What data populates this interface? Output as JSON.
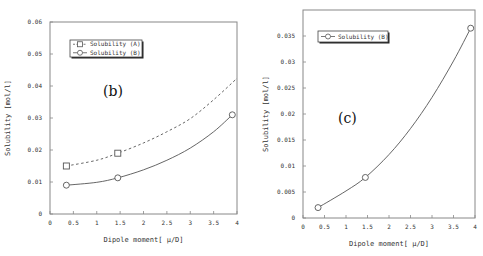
{
  "chart_data": [
    {
      "id": "b",
      "type": "line",
      "panel_label": "(b)",
      "title": "",
      "xlabel": "Dipole moment[ μ/D]",
      "ylabel": "Solubility [mol/l]",
      "xlim": [
        0,
        4
      ],
      "ylim": [
        0,
        0.06
      ],
      "xticks": [
        0,
        0.5,
        1,
        1.5,
        2,
        2.5,
        3,
        3.5,
        4
      ],
      "xtick_labels": [
        "0",
        "0.5",
        "1",
        "1.5",
        "2",
        "2.5",
        "3",
        "3.5",
        "4"
      ],
      "yticks": [
        0,
        0.01,
        0.02,
        0.03,
        0.04,
        0.05,
        0.06
      ],
      "ytick_labels": [
        "0",
        "0.01",
        "0.02",
        "0.03",
        "0.04",
        "0.05",
        "0.06"
      ],
      "grid": false,
      "legend_position": "upper-left",
      "series": [
        {
          "name": "Solubility (A)",
          "marker": "square",
          "line": "dashed",
          "points": [
            [
              0.35,
              0.015
            ],
            [
              1.45,
              0.019
            ]
          ],
          "fit_curve": [
            [
              0.35,
              0.015
            ],
            [
              1.0,
              0.0168
            ],
            [
              1.45,
              0.019
            ],
            [
              2.0,
              0.0222
            ],
            [
              2.5,
              0.0257
            ],
            [
              3.0,
              0.0298
            ],
            [
              3.5,
              0.0357
            ],
            [
              4.0,
              0.0424
            ]
          ]
        },
        {
          "name": "Solubility (B)",
          "marker": "circle",
          "line": "solid",
          "points": [
            [
              0.35,
              0.009
            ],
            [
              1.45,
              0.0113
            ],
            [
              3.9,
              0.031
            ]
          ],
          "fit_curve": [
            [
              0.35,
              0.009
            ],
            [
              1.0,
              0.0099
            ],
            [
              1.45,
              0.0113
            ],
            [
              2.0,
              0.0138
            ],
            [
              2.5,
              0.0168
            ],
            [
              3.0,
              0.0206
            ],
            [
              3.5,
              0.0257
            ],
            [
              3.9,
              0.031
            ]
          ]
        }
      ]
    },
    {
      "id": "c",
      "type": "line",
      "panel_label": "(c)",
      "title": "",
      "xlabel": "Dipole moment[ μ/D]",
      "ylabel": "Solubility [mol/l]",
      "xlim": [
        0,
        4
      ],
      "ylim": [
        0,
        0.04
      ],
      "xticks": [
        0,
        0.5,
        1,
        1.5,
        2,
        2.5,
        3,
        3.5,
        4
      ],
      "xtick_labels": [
        "0",
        "0.5",
        "1",
        "1.5",
        "2",
        "2.5",
        "3",
        "3.5",
        "4"
      ],
      "yticks": [
        0,
        0.005,
        0.01,
        0.015,
        0.02,
        0.025,
        0.03,
        0.035
      ],
      "ytick_labels": [
        "0",
        "0.005",
        "0.01",
        "0.015",
        "0.02",
        "0.025",
        "0.03",
        "0.035"
      ],
      "grid": false,
      "legend_position": "upper-left",
      "series": [
        {
          "name": "Solubility (B)",
          "marker": "circle",
          "line": "solid",
          "points": [
            [
              0.35,
              0.002
            ],
            [
              1.45,
              0.0078
            ],
            [
              3.9,
              0.0365
            ]
          ],
          "fit_curve": [
            [
              0.35,
              0.002
            ],
            [
              1.0,
              0.0052
            ],
            [
              1.45,
              0.0078
            ],
            [
              2.0,
              0.0122
            ],
            [
              2.5,
              0.0172
            ],
            [
              3.0,
              0.0232
            ],
            [
              3.5,
              0.0302
            ],
            [
              3.9,
              0.0365
            ]
          ]
        }
      ]
    }
  ],
  "figure": {
    "background": "#ffffff",
    "axis_color": "#888888",
    "line_color": "#555555"
  }
}
